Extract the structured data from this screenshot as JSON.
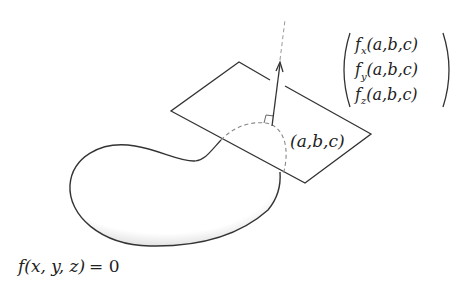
{
  "diagram": {
    "surface_label": {
      "f": "f",
      "args": "(x, y, z)",
      "eq": "= 0"
    },
    "point_label": "(a,b,c)",
    "gradient_vector": {
      "rows": [
        {
          "f": "f",
          "sub": "x",
          "args": "(a,b,c)"
        },
        {
          "f": "f",
          "sub": "y",
          "args": "(a,b,c)"
        },
        {
          "f": "f",
          "sub": "z",
          "args": "(a,b,c)"
        }
      ]
    },
    "elements": [
      "level-surface-blob",
      "tangent-plane",
      "normal-arrow",
      "dashed-normal-line",
      "right-angle-marker",
      "dashed-hidden-curve"
    ],
    "colors": {
      "stroke": "#333333",
      "dashed": "#888888",
      "shade": "#9a9a9a"
    }
  }
}
